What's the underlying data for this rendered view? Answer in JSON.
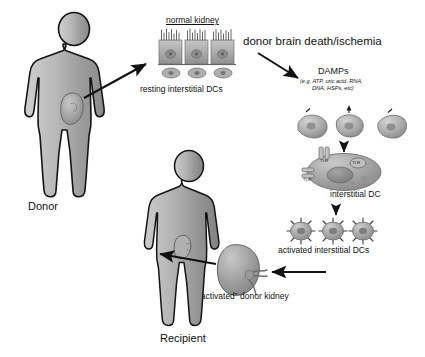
{
  "figure": {
    "title_alt": "Donor brain death and ischemia activate renal interstitial dendritic cells",
    "background": "#ffffff"
  },
  "labels": {
    "donor": "Donor",
    "recipient": "Recipient",
    "normal_kidney": "normal kidney",
    "resting_dcs": "resting interstitial DCs",
    "insult": "donor brain death/ischemia",
    "damps_title": "DAMPs",
    "damps_examples_line1": "(e.g. ATP, uric acid, RNA,",
    "damps_examples_line2": "DNA, HSPs, etc)",
    "interstitial_dc": "interstitial DC",
    "activated_dcs": "activated interstitial DCs",
    "activated_kidney": "“activated” donor kidney",
    "receptor": "TLR"
  },
  "receptors": [
    {
      "name": "TLR",
      "position": "apical"
    },
    {
      "name": "TLR",
      "position": "lateral-left"
    },
    {
      "name": "TLR",
      "position": "central-right"
    }
  ],
  "flow_steps": [
    {
      "step": 1,
      "label": "Donor"
    },
    {
      "step": 2,
      "label": "normal kidney"
    },
    {
      "step": 3,
      "label": "resting interstitial DCs"
    },
    {
      "step": 4,
      "label": "donor brain death/ischemia"
    },
    {
      "step": 5,
      "label": "DAMPs"
    },
    {
      "step": 6,
      "label": "interstitial DC"
    },
    {
      "step": 7,
      "label": "activated interstitial DCs"
    },
    {
      "step": 8,
      "label": "“activated” donor kidney"
    },
    {
      "step": 9,
      "label": "Recipient"
    }
  ],
  "colors": {
    "silhouette_light": "#d8d8d8",
    "silhouette_mid": "#9a9a9a",
    "silhouette_dark": "#6d6d6d",
    "outline": "#141414",
    "kidney_fill": "#a8a8a8",
    "cell_fill": "#b4b4b4",
    "arrow": "#111111",
    "text": "#111111"
  },
  "counts": {
    "resting_dcs_shown": 3,
    "tubule_cells_shown": 3,
    "damp_fragments_shown": 3,
    "activated_dcs_shown": 3
  }
}
